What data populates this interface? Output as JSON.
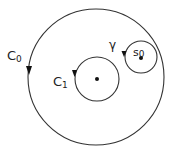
{
  "diagram": {
    "stroke_color": "#333333",
    "contours": [
      {
        "id": "C0",
        "label": "C",
        "subscript": "0",
        "cx": 96,
        "cy": 78,
        "r": 68,
        "orientation": "counterclockwise"
      },
      {
        "id": "C1",
        "label": "C",
        "subscript": "1",
        "cx": 97,
        "cy": 79,
        "r": 22,
        "orientation": "counterclockwise",
        "center_point": true
      },
      {
        "id": "gamma",
        "label": "γ",
        "cx": 146,
        "cy": 56,
        "r": 16,
        "orientation": "counterclockwise",
        "center_point": true
      }
    ],
    "labels": {
      "c0_main": "C",
      "c0_sub": "0",
      "c1_main": "C",
      "c1_sub": "1",
      "gamma": "γ",
      "s0_main": "s",
      "s0_sub": "0"
    }
  }
}
